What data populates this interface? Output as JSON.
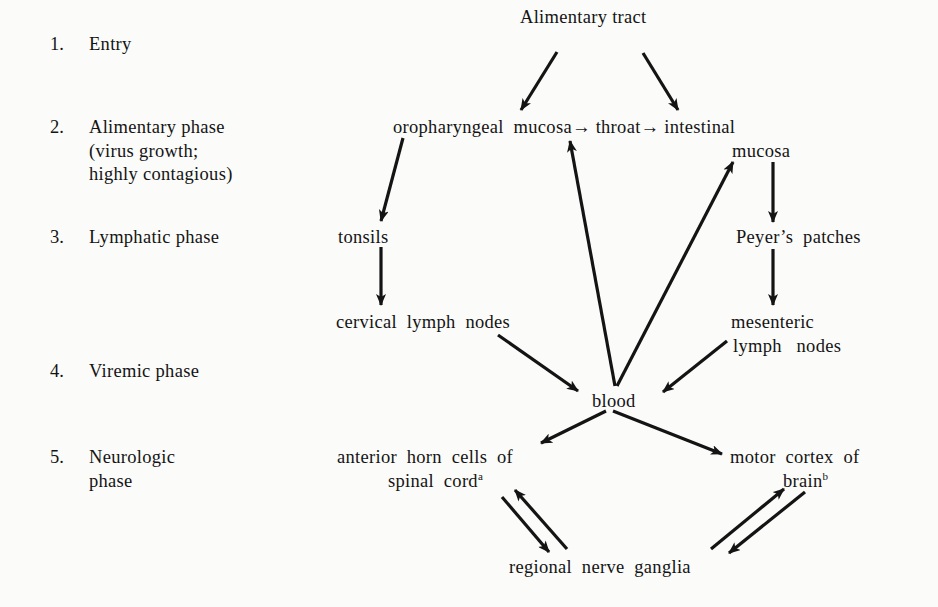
{
  "phases": [
    {
      "number": "1.",
      "label": "Entry"
    },
    {
      "number": "2.",
      "label": "Alimentary phase",
      "sub1": "(virus growth;",
      "sub2": "highly contagious)"
    },
    {
      "number": "3.",
      "label": "Lymphatic phase"
    },
    {
      "number": "4.",
      "label": "Viremic phase"
    },
    {
      "number": "5.",
      "label": "Neurologic",
      "sub1": "phase"
    }
  ],
  "nodes": {
    "alimentary_tract": "Alimentary tract",
    "mucosa_line": "oropharyngeal  mucosa→ throat→ intestinal",
    "intestinal_mucosa_2": "mucosa",
    "tonsils": "tonsils",
    "peyers_patches": "Peyer’s  patches",
    "cervical_lymph_nodes": "cervical  lymph  nodes",
    "mesenteric_1": "mesenteric",
    "mesenteric_2": "lymph   nodes",
    "blood": "blood",
    "anterior_horn_1": "anterior  horn  cells  of",
    "anterior_horn_2": "spinal  cord",
    "anterior_horn_sup": "a",
    "motor_cortex_1": "motor  cortex  of",
    "motor_cortex_2": "brain",
    "motor_cortex_sup": "b",
    "regional_nerve_ganglia": "regional  nerve  ganglia"
  },
  "edges": [
    {
      "from": "Alimentary tract",
      "to": "oropharyngeal mucosa"
    },
    {
      "from": "Alimentary tract",
      "to": "intestinal mucosa"
    },
    {
      "from": "oropharyngeal mucosa",
      "to": "throat"
    },
    {
      "from": "throat",
      "to": "intestinal mucosa"
    },
    {
      "from": "oropharyngeal mucosa",
      "to": "tonsils"
    },
    {
      "from": "tonsils",
      "to": "cervical lymph nodes"
    },
    {
      "from": "intestinal mucosa",
      "to": "Peyer's patches"
    },
    {
      "from": "Peyer's patches",
      "to": "mesenteric lymph nodes"
    },
    {
      "from": "cervical lymph nodes",
      "to": "blood"
    },
    {
      "from": "mesenteric lymph nodes",
      "to": "blood"
    },
    {
      "from": "blood",
      "to": "oropharyngeal mucosa"
    },
    {
      "from": "blood",
      "to": "intestinal mucosa"
    },
    {
      "from": "blood",
      "to": "anterior horn cells of spinal cord"
    },
    {
      "from": "blood",
      "to": "motor cortex of brain"
    },
    {
      "from": "anterior horn cells of spinal cord",
      "to": "regional nerve ganglia"
    },
    {
      "from": "regional nerve ganglia",
      "to": "anterior horn cells of spinal cord"
    },
    {
      "from": "regional nerve ganglia",
      "to": "motor cortex of brain"
    },
    {
      "from": "motor cortex of brain",
      "to": "regional nerve ganglia"
    }
  ],
  "colors": {
    "ink": "#141414",
    "paper": "#fbfbfa"
  }
}
